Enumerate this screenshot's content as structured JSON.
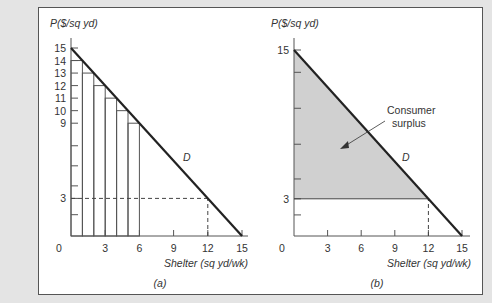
{
  "chart_data": [
    {
      "panel": "a",
      "type": "line",
      "caption": "(a)",
      "ylabel": "P($/sq yd)",
      "xlabel": "Shelter (sq yd/wk)",
      "xlim": [
        0,
        15
      ],
      "ylim": [
        0,
        15
      ],
      "x_ticks": [
        0,
        3,
        6,
        9,
        12,
        15
      ],
      "y_tick_labels": [
        15,
        14,
        13,
        12,
        11,
        10,
        9,
        3
      ],
      "series": [
        {
          "name": "D",
          "x": [
            0,
            15
          ],
          "y": [
            15,
            0
          ]
        }
      ],
      "bars": {
        "description": "Step rectangles under demand curve for units 1..6",
        "x_left": [
          0,
          1,
          2,
          3,
          4,
          5
        ],
        "x_right": [
          1,
          2,
          3,
          4,
          5,
          6
        ],
        "heights": [
          14,
          13,
          12,
          11,
          10,
          9
        ]
      },
      "reference_lines": [
        {
          "type": "dashed",
          "from": [
            0,
            3
          ],
          "to": [
            12,
            3
          ]
        },
        {
          "type": "dashed",
          "from": [
            12,
            0
          ],
          "to": [
            12,
            3
          ]
        }
      ],
      "curve_label": "D"
    },
    {
      "panel": "b",
      "type": "area",
      "caption": "(b)",
      "ylabel": "P($/sq yd)",
      "xlabel": "Shelter (sq yd/wk)",
      "xlim": [
        0,
        15
      ],
      "ylim": [
        0,
        15
      ],
      "x_ticks": [
        0,
        3,
        6,
        9,
        12,
        15
      ],
      "y_tick_labels": [
        15,
        3
      ],
      "series": [
        {
          "name": "D",
          "x": [
            0,
            15
          ],
          "y": [
            15,
            0
          ]
        }
      ],
      "shaded_region": {
        "name": "Consumer surplus",
        "vertices": [
          [
            0,
            15
          ],
          [
            0,
            3
          ],
          [
            12,
            3
          ]
        ]
      },
      "reference_lines": [
        {
          "type": "solid",
          "from": [
            0,
            3
          ],
          "to": [
            12,
            3
          ]
        },
        {
          "type": "dashed",
          "from": [
            12,
            0
          ],
          "to": [
            12,
            3
          ]
        }
      ],
      "annotation": {
        "text_line1": "Consumer",
        "text_line2": "surplus"
      },
      "curve_label": "D"
    }
  ],
  "panels": {
    "a": {
      "caption": "(a)",
      "ylabel": "P($/sq yd)",
      "xlabel": "Shelter (sq yd/wk)",
      "curve": "D"
    },
    "b": {
      "caption": "(b)",
      "ylabel": "P($/sq yd)",
      "xlabel": "Shelter (sq yd/wk)",
      "curve": "D",
      "annot1": "Consumer",
      "annot2": "surplus"
    }
  },
  "colors": {
    "shade": "#d0d0d0",
    "line": "#222222",
    "background": "#e4e4e4"
  }
}
